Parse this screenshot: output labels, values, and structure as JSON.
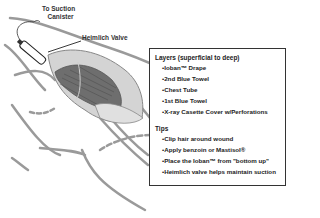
{
  "labels": {
    "suction": [
      "To Suction",
      "Canister"
    ],
    "valve": "Heimlich Valve"
  },
  "legend": {
    "layers_title": "Layers (superficial to deep)",
    "layers": [
      "•Ioban™ Drape",
      "•2nd Blue Towel",
      "•Chest Tube",
      "•1st Blue Towel",
      "•X-ray Casette Cover w/Perforations"
    ],
    "tips_title": "Tips",
    "tips": [
      "•Clip hair around wound",
      "•Apply benzoin or Mastisol®",
      "•Place the Ioban™ from \"bottom up\"",
      "•Heimlich valve helps maintain suction"
    ]
  },
  "colors": {
    "outline": "#8a8a8a",
    "drape": "#c8c8c8",
    "towel": "#6e6e6e",
    "box_border": "#333333"
  }
}
